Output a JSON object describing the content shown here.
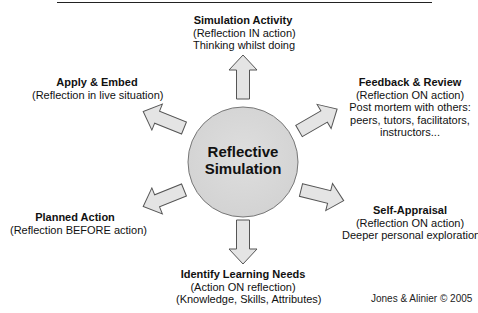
{
  "diagram": {
    "center": {
      "label_line1": "Reflective",
      "label_line2": "Simulation"
    },
    "nodes": [
      {
        "id": "simulation-activity",
        "title": "Simulation Activity",
        "lines": [
          "(Reflection IN action)",
          "Thinking whilst doing"
        ],
        "position": "top"
      },
      {
        "id": "feedback-review",
        "title": "Feedback & Review",
        "lines": [
          "(Reflection ON action)",
          "Post mortem with others:",
          "peers, tutors, facilitators,",
          "instructors..."
        ],
        "position": "upper-right"
      },
      {
        "id": "self-appraisal",
        "title": "Self-Appraisal",
        "lines": [
          "(Reflection ON action)",
          "Deeper personal exploration"
        ],
        "position": "lower-right"
      },
      {
        "id": "identify-learning-needs",
        "title": "Identify Learning Needs",
        "lines": [
          "(Action ON reflection)",
          "(Knowledge, Skills, Attributes)"
        ],
        "position": "bottom"
      },
      {
        "id": "planned-action",
        "title": "Planned Action",
        "lines": [
          "(Reflection BEFORE action)"
        ],
        "position": "lower-left"
      },
      {
        "id": "apply-embed",
        "title": "Apply & Embed",
        "lines": [
          "(Reflection in live situation)"
        ],
        "position": "upper-left"
      }
    ],
    "credit": "Jones & Alinier © 2005",
    "colors": {
      "circle_fill": "#d9d9d9",
      "arrow_fill": "#e4e4e4",
      "stroke": "#555555"
    }
  }
}
